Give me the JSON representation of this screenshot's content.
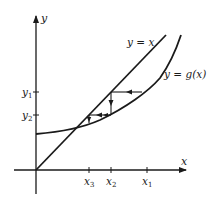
{
  "diagram": {
    "axes": {
      "x_label": "x",
      "y_label": "y"
    },
    "curves": [
      {
        "name": "identity-line",
        "label": "y = x"
      },
      {
        "name": "g-curve",
        "label": "y = g(x)"
      }
    ],
    "y_ticks": [
      {
        "label_base": "y",
        "label_sub": "1"
      },
      {
        "label_base": "y",
        "label_sub": "2"
      }
    ],
    "x_ticks": [
      {
        "label_base": "x",
        "label_sub": "3"
      },
      {
        "label_base": "x",
        "label_sub": "2"
      },
      {
        "label_base": "x",
        "label_sub": "1"
      }
    ],
    "colors": {
      "ink": "#1a1a1a",
      "background": "#ffffff"
    }
  }
}
